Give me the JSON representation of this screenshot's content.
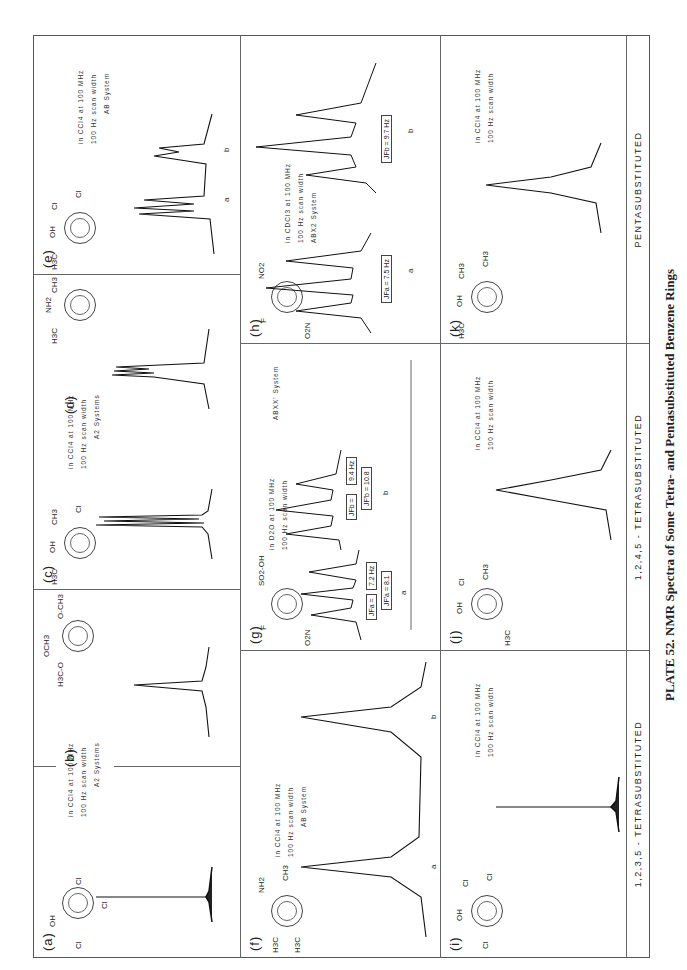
{
  "caption": "PLATE 52. NMR Spectra of Some Tetra- and Pentasubstituted Benzene Rings",
  "sections": [
    {
      "label": "1,2,3,5 - TETRASUBSTITUTED"
    },
    {
      "label": "1,2,4,5 - TETRASUBSTITUTED"
    },
    {
      "label": "PENTASUBSTITUTED"
    }
  ],
  "panels": {
    "a": {
      "label": "(a)",
      "substituents": [
        "OH",
        "Cl",
        "Cl",
        "Cl",
        "a",
        "a"
      ],
      "spectrum": "single sharp singlet"
    },
    "b": {
      "label": "(b)",
      "substituents": [
        "OCH3",
        "H3C-O",
        "O-CH3",
        "a",
        "a"
      ],
      "spectrum": "single singlet"
    },
    "ab_conditions": {
      "line1": "in CCl4 at 100 MHz",
      "line2": "100 Hz scan width",
      "line3": "A2 Systems"
    },
    "c": {
      "label": "(c)",
      "substituents": [
        "OH",
        "H3C",
        "CH3",
        "Cl",
        "a",
        "a"
      ],
      "spectrum": "singlet with fine structure"
    },
    "d": {
      "label": "(d)",
      "substituents": [
        "NH2",
        "H3C",
        "CH3",
        "CH3",
        "a",
        "a"
      ],
      "spectrum": "singlet with fine structure"
    },
    "cd_conditions": {
      "line1": "in CCl4 at 100 MHz",
      "line2": "100 Hz scan width",
      "line3": "A2 Systems"
    },
    "e": {
      "label": "(e)",
      "substituents": [
        "OH",
        "H3C",
        "Cl",
        "Cl",
        "a",
        "b"
      ],
      "conditions": {
        "line1": "in CCl4 at 100 MHz",
        "line2": "100 Hz scan width",
        "line3": "AB System"
      },
      "peaks": [
        "a",
        "b"
      ]
    },
    "f": {
      "label": "(f)",
      "substituents": [
        "NH2",
        "H3C",
        "H3C",
        "CH3",
        "a",
        "b"
      ],
      "conditions": {
        "line1": "in CCl4 at 100 MHz",
        "line2": "100 Hz scan width",
        "line3": "AB System"
      },
      "peaks": [
        "a",
        "b"
      ]
    },
    "g": {
      "label": "(g)",
      "substituents": [
        "F",
        "F",
        "SO2-OH",
        "O2N",
        "a",
        "b"
      ],
      "conditions": {
        "line1": "in D2O at 100 MHz",
        "line2": "100 Hz scan width",
        "line3": "ABXX' System"
      },
      "couplings": {
        "a_jfa": "JFa =",
        "a_val": "7.2 Hz",
        "a_jfpa": "JF'a = 8.1",
        "b_jfb": "JFb =",
        "b_val": "9.4 Hz",
        "b_jfpb": "JF'b = 10.8"
      },
      "peaks": [
        "a",
        "b"
      ]
    },
    "h": {
      "label": "(h)",
      "substituents": [
        "F",
        "F",
        "NO2",
        "O2N",
        "a",
        "b"
      ],
      "conditions": {
        "line1": "in CDCl3 at 100 MHz",
        "line2": "100 Hz scan width",
        "line3": "ABX2 System"
      },
      "couplings": {
        "a": "JFa = 7.5 Hz",
        "b": "JFb = 9.7 Hz"
      },
      "peaks": [
        "a",
        "b"
      ]
    },
    "i": {
      "label": "(i)",
      "substituents": [
        "OH",
        "Cl",
        "Cl",
        "Cl",
        "Cl",
        "a"
      ],
      "conditions": {
        "line1": "in CCl4 at 100 MHz",
        "line2": "100 Hz scan width"
      }
    },
    "j": {
      "label": "(j)",
      "substituents": [
        "OH",
        "Cl",
        "CH3",
        "Cl",
        "H3C",
        "a"
      ],
      "conditions": {
        "line1": "in CCl4 at 100 MHz",
        "line2": "100 Hz scan width"
      }
    },
    "k": {
      "label": "(k)",
      "substituents": [
        "OH",
        "CH3",
        "CH3",
        "Cl",
        "H3C",
        "a"
      ],
      "conditions": {
        "line1": "in CCl4 at 100 MHz",
        "line2": "100 Hz scan width"
      }
    }
  }
}
